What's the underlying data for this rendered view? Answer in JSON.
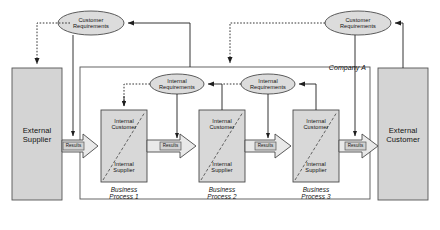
{
  "diagram": {
    "title_label": "Company A",
    "external_supplier": "External\nSupplier",
    "external_supplier_line1": "External",
    "external_supplier_line2": "Supplier",
    "external_customer_line1": "External",
    "external_customer_line2": "Customer",
    "customer_requirements_line1": "Customer",
    "customer_requirements_line2": "Requirements",
    "internal_requirements_line1": "Internal",
    "internal_requirements_line2": "Requirements",
    "internal_customer_line1": "Internal",
    "internal_customer_line2": "Customer",
    "internal_supplier_line1": "Internal",
    "internal_supplier_line2": "Supplier",
    "results_label": "Results",
    "process_word": "Business",
    "processes": [
      {
        "name_line1": "Business",
        "name_line2": "Process 1"
      },
      {
        "name_line1": "Business",
        "name_line2": "Process 2"
      },
      {
        "name_line1": "Business",
        "name_line2": "Process 3"
      }
    ],
    "ellipses": [
      {
        "id": "customer-requirements-left",
        "line1": "Customer",
        "line2": "Requirements"
      },
      {
        "id": "customer-requirements-right",
        "line1": "Customer",
        "line2": "Requirements"
      },
      {
        "id": "internal-requirements-1",
        "line1": "Internal",
        "line2": "Requirements"
      },
      {
        "id": "internal-requirements-2",
        "line1": "Internal",
        "line2": "Requirements"
      }
    ],
    "results_arrows": [
      "Results",
      "Results",
      "Results",
      "Results"
    ],
    "colors": {
      "fill_gray": "#d4d4d4",
      "fill_gray_light": "#dcdcdc",
      "stroke": "#4a4a4a",
      "stroke_dark": "#222222",
      "text": "#111111",
      "background": "#ffffff",
      "arrow_fill": "#e8e8e8"
    }
  }
}
